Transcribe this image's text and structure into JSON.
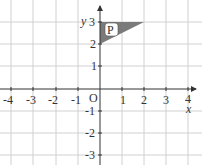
{
  "diagram": {
    "type": "coordinate-grid",
    "axes": {
      "x_label": "x",
      "y_label": "y",
      "origin_label": "O",
      "x_ticks": [
        "-4",
        "-3",
        "-2",
        "-1",
        "1",
        "2",
        "3",
        "4"
      ],
      "y_ticks": [
        "3",
        "2",
        "1",
        "-1",
        "-2",
        "-3"
      ],
      "x_range": [
        -4,
        4
      ],
      "y_range": [
        -3,
        3
      ]
    },
    "shapes": [
      {
        "name": "P",
        "label": "P",
        "type": "triangle",
        "vertices": [
          [
            0,
            3
          ],
          [
            2,
            3
          ],
          [
            0,
            2
          ]
        ],
        "fill": "#7a7a7a"
      }
    ],
    "colors": {
      "grid": "#d0d0d0",
      "axis": "#333333",
      "shape_fill": "#7a7a7a"
    }
  }
}
